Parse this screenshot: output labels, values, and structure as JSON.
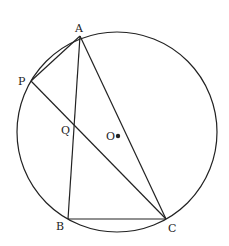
{
  "diagram": {
    "type": "geometry",
    "circle": {
      "name": "circle-O",
      "cx": 117,
      "cy": 132,
      "r": 100
    },
    "center": {
      "label": "O",
      "x": 118,
      "y": 136
    },
    "points": {
      "A": {
        "label": "A",
        "x": 80,
        "y": 36
      },
      "P": {
        "label": "P",
        "x": 31,
        "y": 81
      },
      "Q": {
        "label": "Q",
        "x": 74,
        "y": 127
      },
      "B": {
        "label": "B",
        "x": 68,
        "y": 219
      },
      "C": {
        "label": "C",
        "x": 166,
        "y": 219
      }
    },
    "segments": [
      "AB",
      "AC",
      "BC",
      "AP",
      "PC"
    ],
    "stroke_color": "#222222"
  }
}
